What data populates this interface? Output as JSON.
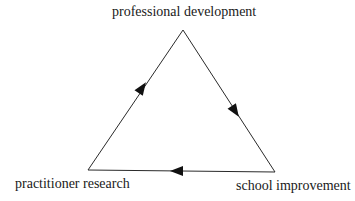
{
  "diagram": {
    "type": "cycle-triangle",
    "nodes": [
      {
        "id": "top",
        "label": "professional development"
      },
      {
        "id": "right",
        "label": "school improvement"
      },
      {
        "id": "left",
        "label": "practitioner research"
      }
    ],
    "edges": [
      {
        "from": "top",
        "to": "right",
        "direction": "down-right"
      },
      {
        "from": "right",
        "to": "left",
        "direction": "left"
      },
      {
        "from": "left",
        "to": "top",
        "direction": "up-right"
      }
    ],
    "colors": {
      "line": "#2a2a2a",
      "arrow": "#111111",
      "background": "#ffffff"
    }
  }
}
